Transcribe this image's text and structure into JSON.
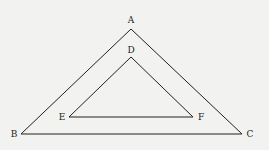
{
  "diagram": {
    "type": "geometry",
    "background": "#f2f2f0",
    "stroke_color": "#222222",
    "outer_triangle": {
      "vertices": {
        "A": {
          "label": "A",
          "x": 131,
          "y": 29,
          "lx": 131,
          "ly": 23
        },
        "B": {
          "label": "B",
          "x": 21,
          "y": 134,
          "lx": 14,
          "ly": 137
        },
        "C": {
          "label": "C",
          "x": 242,
          "y": 134,
          "lx": 250,
          "ly": 137
        }
      }
    },
    "inner_triangle": {
      "vertices": {
        "D": {
          "label": "D",
          "x": 131,
          "y": 57,
          "lx": 131,
          "ly": 53
        },
        "E": {
          "label": "E",
          "x": 69,
          "y": 117,
          "lx": 62,
          "ly": 120
        },
        "F": {
          "label": "F",
          "x": 193,
          "y": 117,
          "lx": 201,
          "ly": 120
        }
      }
    }
  }
}
